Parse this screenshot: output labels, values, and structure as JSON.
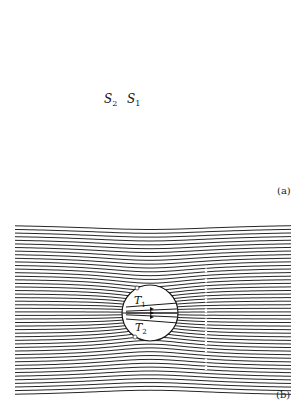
{
  "figure": {
    "panel_a": {
      "label": "(a)",
      "points": [
        {
          "name": "S",
          "sub": "2"
        },
        {
          "name": "S",
          "sub": "1"
        }
      ],
      "circle": {
        "cx": 150,
        "cy": 106,
        "r": 29
      },
      "axis_y": 106,
      "source_x": 138
    },
    "panel_b": {
      "label": "(b)",
      "points": [
        {
          "name": "T",
          "sub": "1"
        },
        {
          "name": "T",
          "sub": "2"
        }
      ],
      "circle": {
        "cx": 150,
        "cy": 313,
        "r": 28
      },
      "dotted_line_x": 206
    }
  }
}
